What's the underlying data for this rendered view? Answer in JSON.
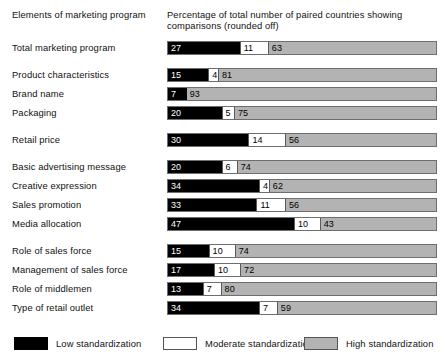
{
  "header": {
    "left_title": "Elements of marketing program",
    "right_title": "Percentage of total number of paired countries showing comparisons (rounded off)"
  },
  "legend": {
    "items": [
      {
        "label": "Low standardization",
        "swatch": "black-swatch",
        "color": "#000000"
      },
      {
        "label": "Moderate standardization",
        "swatch": "white-swatch",
        "color": "#ffffff"
      },
      {
        "label": "High standardization",
        "swatch": "gray-swatch",
        "color": "#b3b3b3"
      }
    ]
  },
  "chart_data": {
    "type": "bar",
    "orientation": "horizontal",
    "stacked": true,
    "title": "",
    "xlabel": "Percentage of total number of paired countries showing comparisons (rounded off)",
    "ylabel": "Elements of marketing program",
    "xlim": [
      0,
      100
    ],
    "grid": false,
    "legend_position": "bottom",
    "series": [
      {
        "name": "Low standardization",
        "color": "#000000",
        "values": [
          27,
          15,
          7,
          20,
          30,
          20,
          34,
          33,
          47,
          15,
          17,
          13,
          34
        ]
      },
      {
        "name": "Moderate standardization",
        "color": "#ffffff",
        "values": [
          11,
          4,
          0,
          5,
          14,
          6,
          4,
          11,
          10,
          10,
          10,
          7,
          7
        ]
      },
      {
        "name": "High standardization",
        "color": "#b3b3b3",
        "values": [
          63,
          81,
          93,
          75,
          56,
          74,
          62,
          56,
          43,
          74,
          72,
          80,
          59
        ]
      }
    ],
    "categories": [
      "Total marketing program",
      "Product characteristics",
      "Brand name",
      "Packaging",
      "Retail price",
      "Basic advertising message",
      "Creative expression",
      "Sales promotion",
      "Media allocation",
      "Role of sales force",
      "Management of sales force",
      "Role of middlemen",
      "Type of retail outlet"
    ],
    "rows": [
      {
        "label": "Total marketing program",
        "low": 27,
        "moderate": 11,
        "high": 63,
        "gap_after": true
      },
      {
        "label": "Product characteristics",
        "low": 15,
        "moderate": 4,
        "high": 81,
        "gap_after": false
      },
      {
        "label": "Brand name",
        "low": 7,
        "moderate": 0,
        "high": 93,
        "gap_after": false
      },
      {
        "label": "Packaging",
        "low": 20,
        "moderate": 5,
        "high": 75,
        "gap_after": true
      },
      {
        "label": "Retail price",
        "low": 30,
        "moderate": 14,
        "high": 56,
        "gap_after": true
      },
      {
        "label": "Basic advertising message",
        "low": 20,
        "moderate": 6,
        "high": 74,
        "gap_after": false
      },
      {
        "label": "Creative expression",
        "low": 34,
        "moderate": 4,
        "high": 62,
        "gap_after": false
      },
      {
        "label": "Sales promotion",
        "low": 33,
        "moderate": 11,
        "high": 56,
        "gap_after": false
      },
      {
        "label": "Media allocation",
        "low": 47,
        "moderate": 10,
        "high": 43,
        "gap_after": true
      },
      {
        "label": "Role of sales force",
        "low": 15,
        "moderate": 10,
        "high": 74,
        "gap_after": false
      },
      {
        "label": "Management of sales force",
        "low": 17,
        "moderate": 10,
        "high": 72,
        "gap_after": false
      },
      {
        "label": "Role of middlemen",
        "low": 13,
        "moderate": 7,
        "high": 80,
        "gap_after": false
      },
      {
        "label": "Type of retail outlet",
        "low": 34,
        "moderate": 7,
        "high": 59,
        "gap_after": false
      }
    ]
  }
}
